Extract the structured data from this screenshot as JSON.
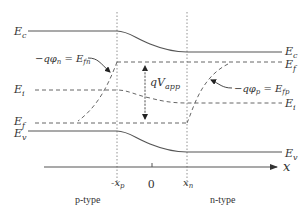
{
  "diagram": {
    "band_labels": {
      "ec_left": "E",
      "ec_left_sub": "c",
      "ec_right": "E",
      "ec_right_sub": "c",
      "ei_left": "E",
      "ei_left_sub": "i",
      "ei_right": "E",
      "ei_right_sub": "i",
      "ef_left": "E",
      "ef_left_sub": "f",
      "ef_right": "E",
      "ef_right_sub": "f",
      "ev_left": "E",
      "ev_left_sub": "v",
      "ev_right": "E",
      "ev_right_sub": "v"
    },
    "annotations": {
      "electron_quasi_fermi": "−qφ",
      "electron_quasi_fermi_sub": "n",
      "electron_quasi_fermi_eq": " = E",
      "electron_quasi_fermi_eq_sub": "fn",
      "hole_quasi_fermi": "−qφ",
      "hole_quasi_fermi_sub": "p",
      "hole_quasi_fermi_eq": " = E",
      "hole_quasi_fermi_eq_sub": "fp",
      "applied_voltage": "qV",
      "applied_voltage_sub": "app"
    },
    "axis": {
      "label": "x",
      "ticks": [
        {
          "label": "-x",
          "sub": "p"
        },
        {
          "label": "0",
          "sub": ""
        },
        {
          "label": "x",
          "sub": "n"
        }
      ]
    },
    "regions": {
      "left": "p-type",
      "right": "n-type"
    },
    "colors": {
      "line": "#555555",
      "text": "#333333",
      "background": "#ffffff"
    }
  }
}
